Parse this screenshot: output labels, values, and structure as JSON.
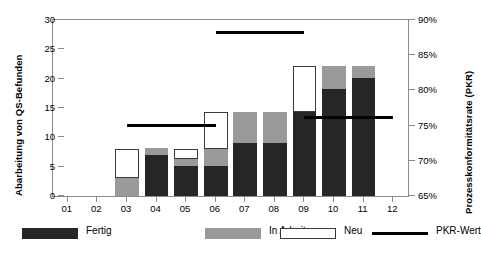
{
  "chart_data": {
    "type": "bar",
    "title": "",
    "subtitle": "",
    "xlabel": "",
    "ylabel": "Abarbeitung von QS-Befunden",
    "ylabel_secondary": "Prozesskonformitätsrate (PKR)",
    "categories": [
      "01",
      "02",
      "03",
      "04",
      "05",
      "06",
      "07",
      "08",
      "09",
      "10",
      "11",
      "12"
    ],
    "ylim": [
      0,
      30
    ],
    "yticks": [
      0,
      5,
      10,
      15,
      20,
      25,
      30
    ],
    "ytick_labels": [
      "0",
      "5",
      "10",
      "15",
      "20",
      "25",
      "30"
    ],
    "ylim_secondary": [
      65,
      90
    ],
    "yticks_secondary": [
      65,
      70,
      75,
      80,
      85,
      90
    ],
    "ytick_labels_secondary": [
      "65%",
      "70%",
      "75%",
      "80%",
      "85%",
      "90%"
    ],
    "grid": false,
    "stacked": true,
    "legend_position": "bottom",
    "series": [
      {
        "name": "Fertig",
        "color": "#262626",
        "values": [
          0,
          0,
          0,
          7.0,
          5.1,
          5.1,
          9.0,
          9.0,
          14.3,
          18.3,
          20.2,
          0
        ]
      },
      {
        "name": "In Arbeit",
        "color": "#9a9a9a",
        "values": [
          0,
          0,
          3.0,
          1.1,
          1.2,
          2.9,
          5.3,
          5.3,
          0,
          3.9,
          2.0,
          0
        ]
      },
      {
        "name": "Neu",
        "color": "#ffffff",
        "values": [
          0,
          0,
          5.0,
          0,
          1.7,
          6.3,
          0,
          0,
          7.9,
          0,
          0,
          0
        ]
      }
    ],
    "totals": [
      0,
      0,
      8.0,
      8.1,
      8.0,
      14.3,
      14.3,
      14.3,
      22.2,
      22.2,
      22.2,
      0
    ],
    "pkr_line": {
      "name": "PKR-Wert",
      "color": "#000000",
      "unit": "%",
      "segments": [
        {
          "from_category": "03",
          "to_category": "06",
          "value": 77.0,
          "left_axis_equivalent": 12.0
        },
        {
          "from_category": "06",
          "to_category": "09",
          "value": 85.0,
          "left_axis_equivalent": 27.9
        },
        {
          "from_category": "09",
          "to_category": "12",
          "value": 75.8,
          "left_axis_equivalent": 13.4
        }
      ]
    }
  },
  "legend": {
    "items": [
      {
        "label": "Fertig",
        "swatch": "solid-dark"
      },
      {
        "label": "In Arbeit",
        "swatch": "solid-gray"
      },
      {
        "label": "Neu",
        "swatch": "outlined-white"
      },
      {
        "label": "PKR-Wert",
        "swatch": "line-black"
      }
    ]
  }
}
